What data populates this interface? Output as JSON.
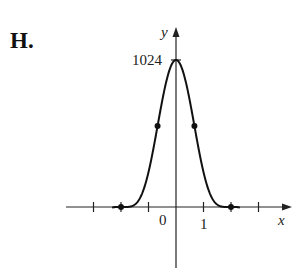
{
  "panel": {
    "label": "H."
  },
  "chart_data": {
    "type": "line",
    "title": "",
    "function_hint": "y = (4 - x^2)^5",
    "xlabel": "x",
    "ylabel": "y",
    "x_tick_labels": [
      "0",
      "1"
    ],
    "y_tick_labels": [
      "1024"
    ],
    "x_ticks": [
      -3,
      -2,
      -1,
      0,
      1,
      2,
      3
    ],
    "y_ticks": [
      1024
    ],
    "xlim": [
      -3.4,
      3.4
    ],
    "ylim": [
      -390,
      1150
    ],
    "grid": false,
    "legend": null,
    "series": [
      {
        "name": "curve",
        "x": [
          -2.32,
          -2.28,
          -2.24,
          -2.2,
          -2.15,
          -2.1,
          -2.05,
          -2.0,
          -1.9,
          -1.8,
          -1.7,
          -1.6,
          -1.5,
          -1.4,
          -1.3,
          -1.2,
          -1.1,
          -1.0,
          -0.9,
          -0.8,
          -0.7,
          -0.6,
          -0.5,
          -0.4,
          -0.3,
          -0.2,
          -0.1,
          0.0,
          0.1,
          0.2,
          0.3,
          0.4,
          0.5,
          0.6,
          0.7,
          0.8,
          0.9,
          1.0,
          1.1,
          1.2,
          1.3,
          1.4,
          1.5,
          1.6,
          1.7,
          1.8,
          1.9,
          2.0,
          2.05,
          2.1,
          2.15,
          2.2,
          2.24,
          2.28,
          2.32
        ],
        "y": [
          -390,
          -270,
          -180,
          -104,
          -45,
          -14,
          -1.9,
          0,
          0,
          0.1,
          1.3,
          7.7,
          26.6,
          73.5,
          160,
          308,
          515,
          243,
          1200,
          1,
          1,
          1,
          1,
          1,
          1,
          1,
          1,
          1024,
          1,
          1,
          1,
          1,
          1,
          1,
          1,
          1,
          1,
          243,
          515,
          308,
          160,
          73.5,
          26.6,
          7.7,
          1.3,
          0.1,
          0,
          0,
          -1.9,
          -14,
          -45,
          -104,
          -180,
          -270,
          -390
        ]
      }
    ],
    "marked_points": [
      {
        "x": -2,
        "y": 0
      },
      {
        "x": -0.67,
        "y": 540
      },
      {
        "x": 0.67,
        "y": 540
      },
      {
        "x": 2,
        "y": 0
      }
    ]
  }
}
